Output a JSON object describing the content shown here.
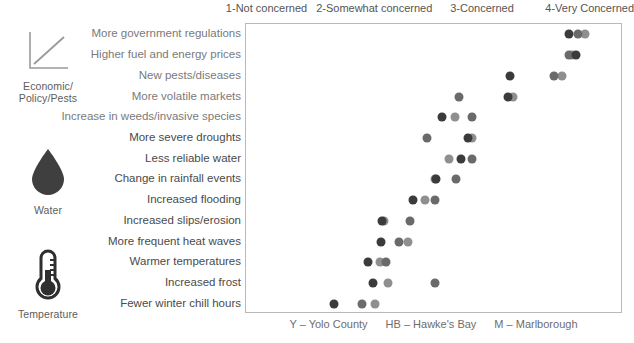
{
  "chart_data": {
    "type": "scatter",
    "title": "",
    "xlabel": "",
    "ylabel": "",
    "xlim": [
      0.8,
      4.3
    ],
    "grid": false,
    "legend_position": "bottom-center",
    "xtick_labels": [
      "1-Not concerned",
      "2-Somewhat concerned",
      "3-Concerned",
      "4-Very Concerned"
    ],
    "xtick_values": [
      1,
      2,
      3,
      4
    ],
    "categories": [
      "More government regulations",
      "Higher fuel and energy prices",
      "New pests/diseases",
      "More volatile markets",
      "Increase in weeds/invasive species",
      "More severe droughts",
      "Less reliable water",
      "Change in rainfall events",
      "Increased flooding",
      "Increased slips/erosion",
      "More frequent heat waves",
      "Warmer temperatures",
      "Increased frost",
      "Fewer winter chill hours"
    ],
    "series": [
      {
        "name": "Y – Yolo County",
        "code": "Y",
        "color": "#3b3b3b",
        "values": [
          3.8,
          3.86,
          3.25,
          3.23,
          2.62,
          2.86,
          2.8,
          2.56,
          2.35,
          2.06,
          2.05,
          1.93,
          1.98,
          1.62
        ]
      },
      {
        "name": "HB – Hawke's Bay",
        "code": "HB",
        "color": "#6a6a6a",
        "values": [
          3.88,
          3.8,
          3.66,
          2.78,
          2.9,
          2.48,
          2.9,
          2.75,
          2.55,
          2.32,
          2.22,
          2.1,
          2.55,
          1.88
        ]
      },
      {
        "name": "M – Marlborough",
        "code": "M",
        "color": "#8f8f8f",
        "values": [
          3.95,
          3.83,
          3.73,
          3.28,
          2.74,
          2.9,
          2.68,
          2.55,
          2.46,
          2.08,
          2.3,
          2.04,
          2.12,
          2.0
        ]
      }
    ],
    "groups": [
      {
        "label": "Economic/\nPolicy/Pests",
        "icon": "line-chart-icon",
        "rows": [
          0,
          1,
          2,
          3,
          4
        ]
      },
      {
        "label": "Water",
        "icon": "water-drop-icon",
        "rows": [
          5,
          6,
          7,
          8,
          9
        ]
      },
      {
        "label": "Temperature",
        "icon": "thermometer-icon",
        "rows": [
          10,
          11,
          12,
          13
        ]
      }
    ],
    "group_labels": {
      "economic": "Economic/",
      "economic2": "Policy/Pests",
      "water": "Water",
      "temperature": "Temperature"
    },
    "legend": [
      "Y – Yolo County",
      "HB – Hawke's Bay",
      "M – Marlborough"
    ],
    "colors": {
      "yolo": "#3b3b3b",
      "hawkes_bay": "#6a6a6a",
      "marlborough": "#8f8f8f",
      "frame": "#b9b9b9",
      "label": "#7a7a7a"
    }
  }
}
